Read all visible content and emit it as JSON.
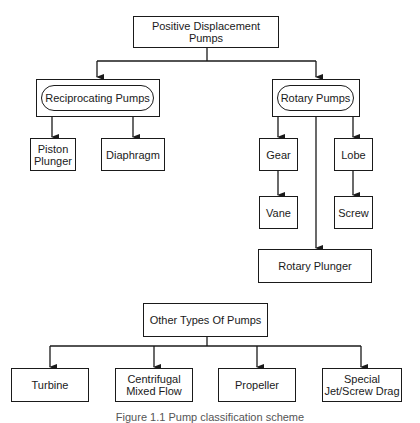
{
  "diagram": {
    "root": {
      "label": "Positive Displacement Pumps"
    },
    "reciprocating": {
      "label": "Reciprocating Pumps",
      "children": [
        {
          "label": "Piston\nPlunger"
        },
        {
          "label": "Diaphragm"
        }
      ]
    },
    "rotary": {
      "label": "Rotary Pumps",
      "children": [
        {
          "label": "Gear"
        },
        {
          "label": "Vane"
        },
        {
          "label": "Lobe"
        },
        {
          "label": "Screw"
        },
        {
          "label": "Rotary Plunger"
        }
      ]
    },
    "other": {
      "label": "Other Types Of Pumps",
      "children": [
        {
          "label": "Turbine"
        },
        {
          "label": "Centrifugal\nMixed Flow"
        },
        {
          "label": "Propeller"
        },
        {
          "label": "Special\nJet/Screw Drag"
        }
      ]
    },
    "caption": "Figure 1.1   Pump classification scheme"
  }
}
